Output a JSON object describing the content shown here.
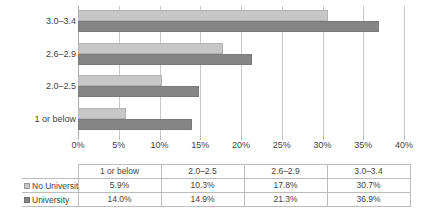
{
  "chart_data": {
    "type": "bar",
    "orientation": "horizontal",
    "title": "",
    "xlabel": "",
    "ylabel": "",
    "categories": [
      "1 or below",
      "2.0–2.5",
      "2.6–2.9",
      "3.0–3.4"
    ],
    "series": [
      {
        "name": "No University",
        "values": [
          5.9,
          10.3,
          17.8,
          30.7
        ],
        "color": "#c7c7c7"
      },
      {
        "name": "University",
        "values": [
          14.0,
          14.9,
          21.3,
          36.9
        ],
        "color": "#858585"
      }
    ],
    "xlim": [
      0,
      40
    ],
    "xticks": [
      0,
      5,
      10,
      15,
      20,
      25,
      30,
      35,
      40
    ],
    "xtick_labels": [
      "0%",
      "5%",
      "10%",
      "15%",
      "20%",
      "25%",
      "30%",
      "35%",
      "40%"
    ],
    "grid": true,
    "legend_position": "data-table",
    "value_suffix": "%"
  },
  "data_table": {
    "corner_label": "",
    "column_headers": [
      "1 or below",
      "2.0–2.5",
      "2.6–2.9",
      "3.0–3.4"
    ],
    "rows": [
      {
        "label": "No University",
        "marker": "legend-swatch-light",
        "values": [
          "5.9%",
          "10.3%",
          "17.8%",
          "30.7%"
        ]
      },
      {
        "label": "University",
        "marker": "legend-swatch-dark",
        "values": [
          "14.0%",
          "14.9%",
          "21.3%",
          "36.9%"
        ]
      }
    ]
  }
}
